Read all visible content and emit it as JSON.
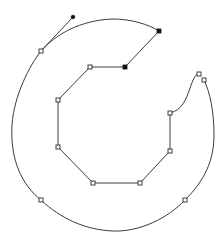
{
  "diagram": {
    "colors": {
      "background": "#ffffff",
      "stroke": "#3a3a3a",
      "anchor_fill_open": "#ffffff",
      "anchor_fill_selected": "#111111"
    },
    "outer_path": "M 41 51 C 30 65, 14 95, 12 125 C 10 160, 22 185, 41 200 C 60 218, 85 230, 113 231 C 140 232, 168 218, 185 200 C 205 180, 214 160, 214 135 C 214 112, 210 92, 204 80",
    "outer_top_path": "M 41 51 C 55 35, 80 20, 113 19 C 130 19, 148 24, 159 31",
    "inner_path": "M 159 31 L 125 67 L 90 67 L 58 100 L 58 147 L 93 183 L 140 183 L 170 151 L 170 113 C 182 110, 186 100, 190 88 C 193 80, 195 74, 199 74",
    "handle": {
      "from": [
        41,
        51
      ],
      "to": [
        73,
        17
      ]
    },
    "anchors_open": [
      [
        41,
        51
      ],
      [
        90,
        67
      ],
      [
        58,
        100
      ],
      [
        58,
        147
      ],
      [
        93,
        183
      ],
      [
        140,
        183
      ],
      [
        170,
        151
      ],
      [
        170,
        113
      ],
      [
        199,
        74
      ],
      [
        204,
        80
      ],
      [
        41,
        200
      ],
      [
        185,
        200
      ]
    ],
    "anchors_filled": [
      [
        159,
        31
      ],
      [
        125,
        67
      ]
    ],
    "handle_end": [
      73,
      17
    ]
  }
}
